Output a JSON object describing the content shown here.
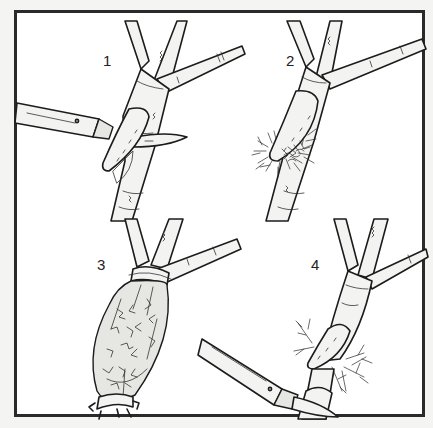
{
  "figure": {
    "title": "",
    "panels": [
      {
        "number": "1",
        "depicts": "knife cutting upward slanting notch into stem below branch fork"
      },
      {
        "number": "2",
        "depicts": "moss packed around the cut tongue of the stem"
      },
      {
        "number": "3",
        "depicts": "moss ball wrapped in plastic sheet and tied at both ends"
      },
      {
        "number": "4",
        "depicts": "rooted stem severed below new roots with knife"
      }
    ]
  },
  "colors": {
    "frame": "#2a2a2a",
    "background": "#ffffff",
    "page": "#f4f4f2",
    "ink": "#1c1c1c"
  }
}
